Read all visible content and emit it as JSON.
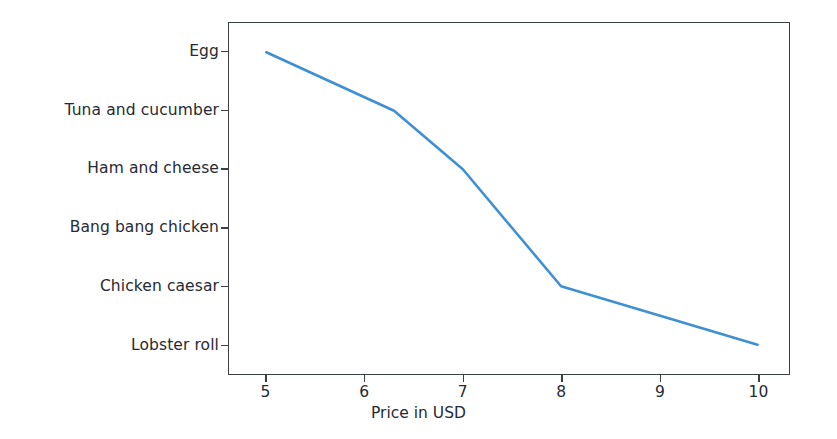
{
  "chart_data": {
    "type": "line",
    "title": "",
    "xlabel": "Price in USD",
    "ylabel": "",
    "xlim": [
      4.62,
      10.32
    ],
    "ylim_categories_top_to_bottom": true,
    "grid": false,
    "legend": null,
    "line_color": "#3d90d4",
    "line_width": 2.6,
    "categories": [
      "Egg",
      "Tuna and cucumber",
      "Ham and cheese",
      "Bang bang chicken",
      "Chicken caesar",
      "Lobster roll"
    ],
    "values": [
      5.0,
      6.3,
      7.0,
      7.5,
      8.0,
      10.0
    ],
    "points": [
      {
        "category": "Egg",
        "price": 5.0
      },
      {
        "category": "Tuna and cucumber",
        "price": 6.3
      },
      {
        "category": "Ham and cheese",
        "price": 7.0
      },
      {
        "category": "Bang bang chicken",
        "price": 7.5
      },
      {
        "category": "Chicken caesar",
        "price": 8.0
      },
      {
        "category": "Lobster roll",
        "price": 10.0
      }
    ],
    "xticks": [
      "5",
      "6",
      "7",
      "8",
      "9",
      "10"
    ],
    "xtick_values": [
      5,
      6,
      7,
      8,
      9,
      10
    ],
    "yticks": [
      "Egg",
      "Tuna and cucumber",
      "Ham and cheese",
      "Bang bang chicken",
      "Chicken caesar",
      "Lobster roll"
    ]
  },
  "colors": {
    "line": "#3d90d4",
    "axis": "#3c3f46",
    "text": "#262a33",
    "background": "#ffffff"
  }
}
